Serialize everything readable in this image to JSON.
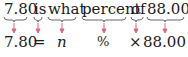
{
  "question": {
    "words": [
      "7.80",
      "is",
      "what",
      "percent",
      "of",
      "88.00?"
    ]
  },
  "equation": {
    "terms": [
      "7.80",
      "=",
      "n",
      "%",
      "×",
      "88.00"
    ]
  },
  "colors": {
    "text": "#1a1a1a",
    "arrow": "#d9687a",
    "brace": "#555555"
  }
}
